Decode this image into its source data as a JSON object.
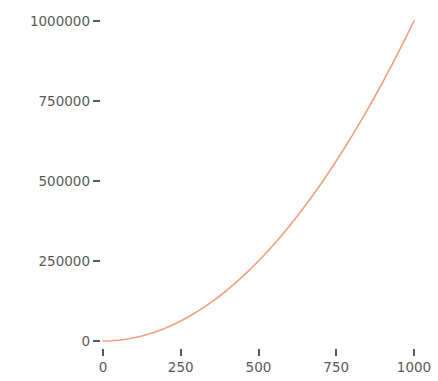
{
  "chart_data": {
    "type": "line",
    "title": "",
    "subtitle": "",
    "xlabel": "",
    "ylabel": "",
    "xlim": [
      0,
      1000
    ],
    "ylim": [
      0,
      1000000
    ],
    "grid": false,
    "legend": null,
    "annotations": [],
    "xticks": [
      0,
      250,
      500,
      750,
      1000
    ],
    "xtick_labels": [
      "0",
      "250",
      "500",
      "750",
      "1000"
    ],
    "yticks": [
      0,
      250000,
      500000,
      750000,
      1000000
    ],
    "ytick_labels": [
      "0",
      "250000",
      "500000",
      "750000",
      "1000000"
    ],
    "series": [
      {
        "name": "y = x^2",
        "color": "#F2A07B",
        "line_width": 1.6,
        "x": [
          0,
          25,
          50,
          75,
          100,
          125,
          150,
          175,
          200,
          225,
          250,
          275,
          300,
          325,
          350,
          375,
          400,
          425,
          450,
          475,
          500,
          525,
          550,
          575,
          600,
          625,
          650,
          675,
          700,
          725,
          750,
          775,
          800,
          825,
          850,
          875,
          900,
          925,
          950,
          975,
          1000
        ],
        "values": [
          0,
          625,
          2500,
          5625,
          10000,
          15625,
          22500,
          30625,
          40000,
          50625,
          62500,
          75625,
          90000,
          105625,
          122500,
          140625,
          160000,
          180625,
          202500,
          225625,
          250000,
          275625,
          302500,
          330625,
          360000,
          390625,
          422500,
          455625,
          490000,
          525625,
          562500,
          600625,
          640000,
          680625,
          722500,
          765625,
          810000,
          855625,
          902500,
          950625,
          1000000
        ]
      }
    ]
  },
  "axis": {
    "tick_color": "#595959",
    "label_color": "#595959"
  },
  "background": "#ffffff"
}
